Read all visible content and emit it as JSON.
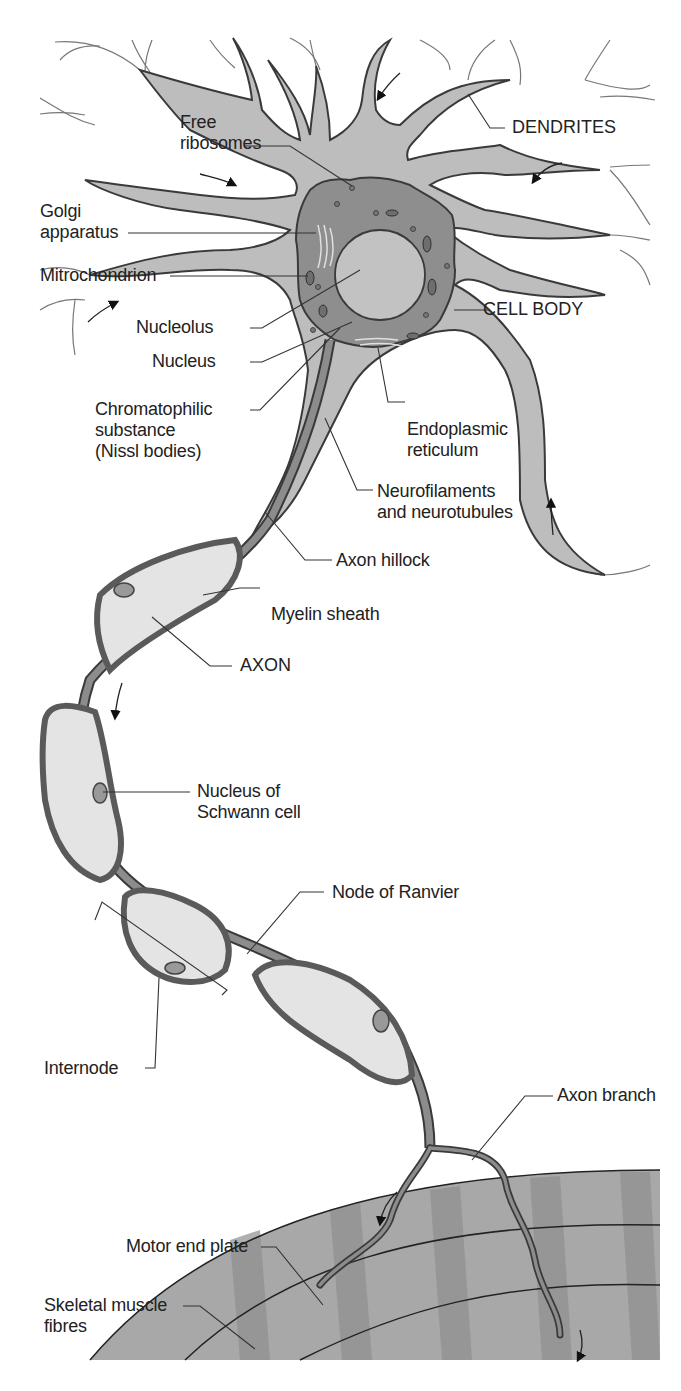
{
  "diagram": {
    "colors": {
      "background": "#ffffff",
      "cell_fill": "#b8b8b8",
      "cell_dark": "#8a8a8a",
      "cell_outline": "#3a3a3a",
      "myelin_fill": "#e4e4e4",
      "muscle_light": "#b0b0b0",
      "muscle_dark": "#8c8c8c",
      "leader_line": "#333333",
      "label_text": "#222222"
    },
    "labels": {
      "free_ribosomes": "Free\nribosomes",
      "dendrites": "DENDRITES",
      "golgi_apparatus": "Golgi\napparatus",
      "mitochondrion": "Mitrochondrion",
      "cell_body": "CELL BODY",
      "nucleolus": "Nucleolus",
      "nucleus": "Nucleus",
      "chromatophilic_substance": "Chromatophilic\nsubstance\n(Nissl bodies)",
      "endoplasmic_reticulum": "Endoplasmic\nreticulum",
      "neurofilaments": "Neurofilaments\nand neurotubules",
      "axon_hillock": "Axon hillock",
      "myelin_sheath": "Myelin sheath",
      "axon": "AXON",
      "nucleus_schwann": "Nucleus of\nSchwann cell",
      "node_of_ranvier": "Node of Ranvier",
      "internode": "Internode",
      "axon_branch": "Axon branch",
      "motor_end_plate": "Motor end plate",
      "skeletal_muscle": "Skeletal muscle\nfibres"
    }
  }
}
